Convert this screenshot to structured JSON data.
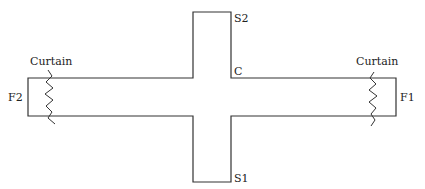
{
  "diagram": {
    "type": "cross-shaped channel",
    "labels": {
      "curtain_left": "Curtain",
      "curtain_right": "Curtain",
      "f2": "F2",
      "f1": "F1",
      "s2": "S2",
      "s1": "S1",
      "c": "C"
    },
    "colors": {
      "stroke": "#333333",
      "background": "#ffffff"
    }
  }
}
